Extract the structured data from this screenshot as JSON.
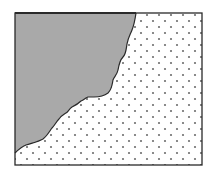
{
  "diagram": {
    "colors": {
      "background": "#ffffff",
      "border": "#2a2a2a",
      "shaded_fill": "#a9a9a9",
      "dot": "#6e6e6e"
    },
    "regions": [
      {
        "name": "shaded-region",
        "pattern": "solid-gray"
      },
      {
        "name": "dotted-region",
        "pattern": "dots"
      }
    ]
  }
}
